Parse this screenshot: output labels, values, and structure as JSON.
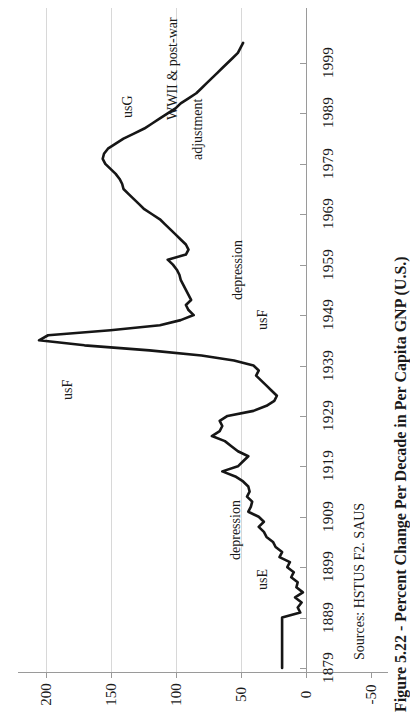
{
  "figure": {
    "caption": "Figure 5.22 - Percent Change Per Decade in Per Capita GNP (U.S.)",
    "source": "Sources: HSTUS F2. SAUS"
  },
  "annotations": [
    {
      "name": "usg-label",
      "text": "usG",
      "x": 120,
      "y": 118
    },
    {
      "name": "wwii-label-line1",
      "text": "WWII & post-war",
      "x": 165,
      "y": 120
    },
    {
      "name": "wwii-label-line2",
      "text": "adjustment",
      "x": 190,
      "y": 160
    },
    {
      "name": "depression-usf-line1",
      "text": "depression",
      "x": 230,
      "y": 300
    },
    {
      "name": "depression-usf-line2",
      "text": "usF",
      "x": 255,
      "y": 330
    },
    {
      "name": "usf-label",
      "text": "usF",
      "x": 60,
      "y": 400
    },
    {
      "name": "depression-use-line1",
      "text": "depression",
      "x": 228,
      "y": 560
    },
    {
      "name": "depression-use-line2",
      "text": "usE",
      "x": 255,
      "y": 590
    }
  ],
  "chart_data": {
    "type": "line",
    "title": "Figure 5.22 - Percent Change Per Decade in Per Capita GNP (U.S.)",
    "orientation": "rotated-90ccw",
    "xlabel": "Year",
    "ylabel": "Percent Change Per Decade",
    "xlim": [
      1879,
      2003
    ],
    "ylim": [
      -50,
      220
    ],
    "grid": true,
    "legend": null,
    "x_tick_labels": [
      "1879",
      "1889",
      "1899",
      "1909",
      "1919",
      "1929",
      "1939",
      "1949",
      "1959",
      "1969",
      "1979",
      "1989",
      "1999"
    ],
    "y_tick_labels": [
      "200",
      "150",
      "100",
      "50",
      "0",
      "-50"
    ],
    "y_ticks": [
      200,
      150,
      100,
      50,
      0,
      -50
    ],
    "x": [
      1879,
      1881,
      1883,
      1885,
      1887,
      1889,
      1890,
      1891,
      1892,
      1893,
      1894,
      1895,
      1896,
      1897,
      1898,
      1899,
      1900,
      1901,
      1902,
      1903,
      1904,
      1905,
      1906,
      1907,
      1908,
      1909,
      1910,
      1911,
      1912,
      1913,
      1914,
      1915,
      1916,
      1917,
      1918,
      1919,
      1920,
      1921,
      1922,
      1923,
      1924,
      1925,
      1926,
      1927,
      1928,
      1929,
      1930,
      1931,
      1932,
      1933,
      1934,
      1935,
      1936,
      1937,
      1938,
      1939,
      1940,
      1941,
      1942,
      1943,
      1944,
      1945,
      1946,
      1947,
      1948,
      1949,
      1950,
      1951,
      1952,
      1953,
      1954,
      1955,
      1956,
      1957,
      1958,
      1959,
      1960,
      1961,
      1962,
      1963,
      1964,
      1965,
      1966,
      1967,
      1968,
      1969,
      1970,
      1971,
      1972,
      1973,
      1974,
      1975,
      1976,
      1977,
      1978,
      1979,
      1980,
      1981,
      1982,
      1983,
      1984,
      1985,
      1986,
      1987,
      1988,
      1989,
      1990,
      1991,
      1992,
      1993,
      1994,
      1995,
      1996,
      1997,
      1998,
      1999,
      2000,
      2001,
      2002,
      2003
    ],
    "values": [
      18,
      18,
      18,
      18,
      18,
      18,
      4,
      6,
      3,
      8,
      2,
      7,
      6,
      11,
      9,
      14,
      12,
      20,
      18,
      23,
      25,
      30,
      32,
      36,
      32,
      36,
      44,
      42,
      41,
      45,
      43,
      44,
      48,
      54,
      64,
      52,
      48,
      44,
      52,
      57,
      62,
      72,
      66,
      64,
      66,
      60,
      40,
      30,
      24,
      22,
      26,
      30,
      34,
      38,
      36,
      40,
      55,
      80,
      120,
      170,
      205,
      198,
      150,
      112,
      96,
      86,
      90,
      92,
      88,
      90,
      92,
      94,
      96,
      97,
      99,
      102,
      106,
      92,
      90,
      92,
      96,
      100,
      104,
      108,
      112,
      118,
      124,
      128,
      132,
      136,
      140,
      141,
      143,
      146,
      150,
      154,
      156,
      155,
      152,
      146,
      140,
      132,
      124,
      118,
      112,
      106,
      100,
      96,
      90,
      84,
      80,
      76,
      72,
      68,
      64,
      60,
      56,
      52,
      50,
      48
    ]
  }
}
